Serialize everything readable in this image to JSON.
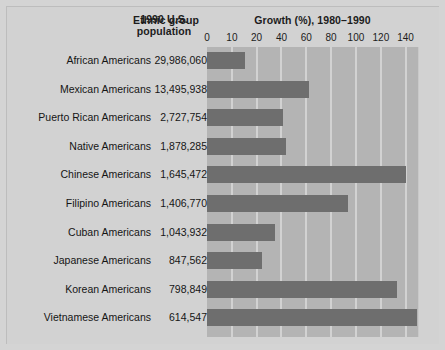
{
  "header": {
    "col_group": "Ethnic group",
    "col_population": "1990 U.S.\npopulation",
    "col_population_line1": "1990 U.S.",
    "col_population_line2": "population",
    "chart_title": "Growth (%), 1980–1990"
  },
  "colors": {
    "page_background": "#d4d4d4",
    "plot_background": "#b4b4b4",
    "bar": "#6e6e6e",
    "gridline": "#d2d2d2",
    "text": "#151515"
  },
  "chart_data": {
    "type": "bar",
    "orientation": "horizontal",
    "title": "Growth (%), 1980–1990",
    "xlabel": "Growth (%), 1980–1990",
    "ylabel": "Ethnic group",
    "grid": true,
    "legend": null,
    "xlim": [
      0,
      140
    ],
    "xticks": [
      0,
      10,
      20,
      40,
      60,
      80,
      100,
      120,
      140
    ],
    "xtick_labels": [
      "0",
      "10",
      "20",
      "40",
      "60",
      "80",
      "100",
      "120",
      "140"
    ],
    "xtick_positions_pct": [
      0,
      11.8,
      23.5,
      35.3,
      47.1,
      58.8,
      70.6,
      82.4,
      94.1
    ],
    "categories": [
      "African Americans",
      "Mexican Americans",
      "Puerto Rican Americans",
      "Native Americans",
      "Chinese Americans",
      "Filipino Americans",
      "Cuban Americans",
      "Japanese Americans",
      "Korean Americans",
      "Vietnamese Americans"
    ],
    "values": [
      13,
      54,
      35,
      38,
      104,
      82,
      30,
      21,
      125,
      135
    ],
    "populations": [
      "29,986,060",
      "13,495,938",
      "2,727,754",
      "1,878,285",
      "1,645,472",
      "1,406,770",
      "1,043,932",
      "847,562",
      "798,849",
      "614,547"
    ],
    "bar_extent_pct": [
      17.9,
      48.3,
      35.9,
      37.3,
      94.2,
      66.8,
      32.4,
      26.0,
      90.1,
      99.5
    ]
  }
}
